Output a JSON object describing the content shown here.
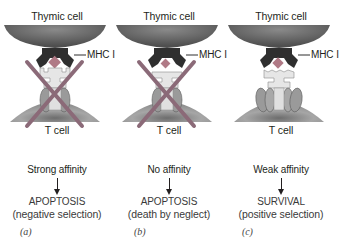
{
  "panels": [
    {
      "letter": "(a)",
      "top_cell": "Thymic cell",
      "mhc": "MHC I",
      "bottom_cell": "T cell",
      "affinity": "Strong affinity",
      "outcome": "APOPTOSIS",
      "detail": "(negative selection)",
      "crossed_out": true,
      "binding": "strong"
    },
    {
      "letter": "(b)",
      "top_cell": "Thymic cell",
      "mhc": "MHC I",
      "bottom_cell": "T cell",
      "affinity": "No affinity",
      "outcome": "APOPTOSIS",
      "detail": "(death by neglect)",
      "crossed_out": true,
      "binding": "none"
    },
    {
      "letter": "(c)",
      "top_cell": "Thymic cell",
      "mhc": "MHC I",
      "bottom_cell": "T cell",
      "affinity": "Weak affinity",
      "outcome": "SURVIVAL",
      "detail": "(positive selection)",
      "crossed_out": false,
      "binding": "weak"
    }
  ],
  "colors": {
    "cross": "#8b6a78",
    "peptide": "#b07a86",
    "mhc": "#2f2f2f",
    "tcr": "#e6e6e6",
    "cd_proteins": "#9a9a9a",
    "thymic_cell": "#6e6e6e",
    "t_cell": "#9c9c9c"
  }
}
